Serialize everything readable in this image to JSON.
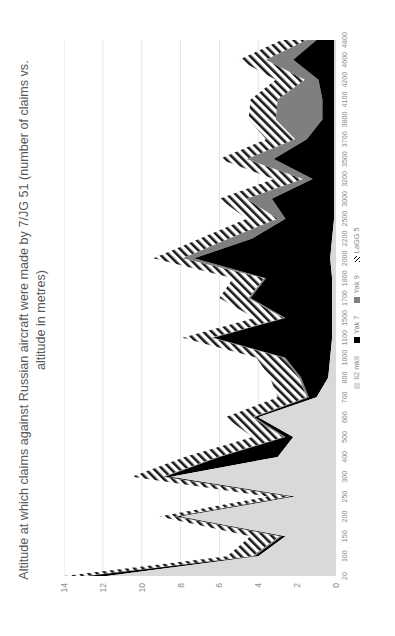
{
  "chart_data": {
    "type": "area",
    "title": "Altitude at which claims against Russian aircraft were made by 7/JG 51 (number of claims vs. altitude in metres)",
    "xlabel": "",
    "ylabel": "",
    "orientation": "rotated-90-ccw",
    "stacked": true,
    "grid": true,
    "legend_position": "bottom",
    "ylim": [
      0,
      14
    ],
    "yticks": [
      0,
      2,
      4,
      6,
      8,
      10,
      12,
      14
    ],
    "categories": [
      "20",
      "100",
      "150",
      "200",
      "250",
      "300",
      "400",
      "500",
      "600",
      "700",
      "800",
      "1000",
      "1100",
      "1500",
      "1700",
      "1800",
      "2000",
      "2200",
      "2500",
      "3000",
      "3200",
      "3500",
      "3700",
      "3800",
      "4100",
      "4200",
      "4600",
      "4800"
    ],
    "series": [
      {
        "name": "Il2 mkII",
        "color": "#d9d9d9",
        "values": [
          11.8,
          4.0,
          2.6,
          8.0,
          2.1,
          8.5,
          3.0,
          2.2,
          4.0,
          1.0,
          0.4,
          0.3,
          0.2,
          0.2,
          0.2,
          0.2,
          0.3,
          0.2,
          0.1,
          0.1,
          0.1,
          0.1,
          0.1,
          0.1,
          0.1,
          0.1,
          0.1,
          0.1
        ]
      },
      {
        "name": "Yak 7",
        "color": "#000000",
        "values": [
          1.0,
          0.2,
          0.2,
          0.2,
          0.2,
          0.3,
          3.0,
          0.4,
          0.2,
          0.4,
          1.4,
          2.3,
          6.1,
          2.4,
          4.2,
          3.4,
          7.0,
          4.1,
          2.5,
          3.2,
          1.1,
          3.1,
          1.4,
          0.6,
          0.6,
          0.8,
          2.1,
          0.9
        ]
      },
      {
        "name": "Yak 9",
        "color": "#7f7f7f",
        "values": [
          0.1,
          0.1,
          0.1,
          0.1,
          0.1,
          0.1,
          0.1,
          0.1,
          0.1,
          0.1,
          0.1,
          0.1,
          0.1,
          0.1,
          0.1,
          0.1,
          0.6,
          1.2,
          0.4,
          1.3,
          0.5,
          1.4,
          0.6,
          2.4,
          2.3,
          0.7,
          1.4,
          0.5
        ]
      },
      {
        "name": "LaGG 5",
        "color": "hatched",
        "values": [
          1.1,
          1.3,
          1.5,
          0.8,
          1.1,
          1.6,
          1.7,
          1.6,
          1.4,
          1.5,
          1.5,
          1.4,
          1.5,
          1.5,
          1.5,
          1.6,
          1.5,
          1.5,
          1.6,
          1.4,
          1.5,
          1.4,
          1.5,
          1.4,
          1.4,
          1.5,
          1.4,
          1.3
        ]
      }
    ]
  }
}
